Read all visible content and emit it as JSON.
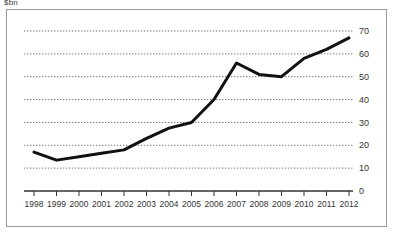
{
  "figure": {
    "unit_label": "$bn",
    "frame_border_color": "#9a9a9a",
    "background_color": "#ffffff"
  },
  "chart_data": {
    "type": "line",
    "title": "",
    "subtitle": "",
    "xlabel": "",
    "ylabel": "$bn",
    "categories": [
      "1998",
      "1999",
      "2000",
      "2001",
      "2002",
      "2003",
      "2004",
      "2005",
      "2006",
      "2007",
      "2008",
      "2009",
      "2010",
      "2011",
      "2012"
    ],
    "x": [
      1998,
      1999,
      2000,
      2001,
      2002,
      2003,
      2004,
      2005,
      2006,
      2007,
      2008,
      2009,
      2010,
      2011,
      2012
    ],
    "values": [
      17,
      13.5,
      15,
      16.5,
      18,
      23,
      27.5,
      30,
      40,
      56,
      51,
      50,
      58,
      62,
      67
    ],
    "series": [
      {
        "name": "series-1",
        "color": "#111111",
        "line_width": 3,
        "values": [
          17,
          13.5,
          15,
          16.5,
          18,
          23,
          27.5,
          30,
          40,
          56,
          51,
          50,
          58,
          62,
          67
        ]
      }
    ],
    "ylim": [
      0,
      70
    ],
    "yticks": [
      0,
      10,
      20,
      30,
      40,
      50,
      60,
      70
    ],
    "ytick_labels": [
      "0",
      "10",
      "20",
      "30",
      "40",
      "50",
      "60",
      "70"
    ],
    "ytick_position": "right",
    "xtick_labels": [
      "1998",
      "1999",
      "2000",
      "2001",
      "2002",
      "2003",
      "2004",
      "2005",
      "2006",
      "2007",
      "2008",
      "2009",
      "2010",
      "2011",
      "2012"
    ],
    "grid": true,
    "grid_style": "dotted",
    "grid_axis": "y",
    "grid_color": "#777777",
    "legend": false,
    "legend_position": "none",
    "axis_line_color": "#333333",
    "annotations": []
  }
}
